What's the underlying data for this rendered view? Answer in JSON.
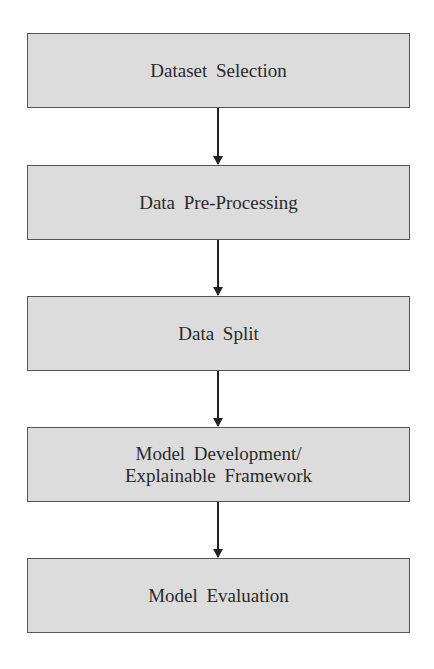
{
  "flowchart": {
    "steps": [
      {
        "label": "Dataset   Selection"
      },
      {
        "label": "Data   Pre-Processing"
      },
      {
        "label": "Data   Split"
      },
      {
        "label": "Model Development/\nExplainable Framework"
      },
      {
        "label": "Model Evaluation"
      }
    ],
    "colors": {
      "box_fill": "#dcdcdc",
      "box_border": "#555555",
      "arrow": "#222222",
      "text": "#2a2a2a"
    }
  }
}
